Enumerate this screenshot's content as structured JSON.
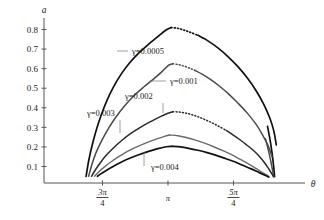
{
  "chart_data": {
    "type": "line",
    "title": "",
    "xlabel": "θ",
    "ylabel": "a",
    "xlim": [
      2.1598,
      4.4506
    ],
    "ylim": [
      0,
      0.87
    ],
    "grid": false,
    "legend_position": "inline-annotations",
    "x_ticks": [
      {
        "value": 2.35619,
        "label": "3π/4",
        "numerator": "3π",
        "denominator": "4"
      },
      {
        "value": 3.14159,
        "label": "π",
        "numerator": "π",
        "denominator": ""
      },
      {
        "value": 3.92699,
        "label": "5π/4",
        "numerator": "5π",
        "denominator": "4"
      }
    ],
    "y_ticks": [
      {
        "value": 0.1,
        "label": "0.1"
      },
      {
        "value": 0.2,
        "label": "0.2"
      },
      {
        "value": 0.3,
        "label": "0.3"
      },
      {
        "value": 0.4,
        "label": "0.4"
      },
      {
        "value": 0.5,
        "label": "0.5"
      },
      {
        "value": 0.6,
        "label": "0.6"
      },
      {
        "value": 0.7,
        "label": "0.7"
      },
      {
        "value": 0.8,
        "label": "0.8"
      }
    ],
    "series": [
      {
        "name": "γ=0.0005",
        "gamma": 0.0005,
        "color": "#111111",
        "stroke_width": 1.7,
        "peak": {
          "x": 3.1416,
          "y": 0.81
        },
        "solid_points": [
          [
            2.1598,
            0.05
          ],
          [
            2.19,
            0.128
          ],
          [
            2.23,
            0.205
          ],
          [
            2.28,
            0.284
          ],
          [
            2.34,
            0.362
          ],
          [
            2.41,
            0.438
          ],
          [
            2.49,
            0.508
          ],
          [
            2.58,
            0.572
          ],
          [
            2.68,
            0.629
          ],
          [
            2.79,
            0.679
          ],
          [
            2.9,
            0.722
          ],
          [
            3.02,
            0.764
          ],
          [
            3.11,
            0.795
          ],
          [
            3.18,
            0.81
          ]
        ],
        "dotted_points": [
          [
            3.18,
            0.81
          ],
          [
            3.26,
            0.806
          ],
          [
            3.34,
            0.796
          ],
          [
            3.42,
            0.784
          ],
          [
            3.5,
            0.77
          ]
        ],
        "tail_points": [
          [
            3.5,
            0.77
          ],
          [
            3.62,
            0.742
          ],
          [
            3.74,
            0.706
          ],
          [
            3.86,
            0.662
          ],
          [
            3.98,
            0.61
          ],
          [
            4.1,
            0.548
          ],
          [
            4.2,
            0.486
          ],
          [
            4.29,
            0.418
          ],
          [
            4.36,
            0.35
          ],
          [
            4.41,
            0.282
          ],
          [
            4.44,
            0.21
          ]
        ],
        "drop_points": [
          [
            4.335,
            0.305
          ],
          [
            4.37,
            0.225
          ],
          [
            4.395,
            0.15
          ],
          [
            4.412,
            0.085
          ],
          [
            4.42,
            0.048
          ]
        ]
      },
      {
        "name": "γ=0.001",
        "gamma": 0.001,
        "color": "#4a4a4a",
        "stroke_width": 1.5,
        "peak": {
          "x": 3.1416,
          "y": 0.625
        },
        "solid_points": [
          [
            2.19,
            0.05
          ],
          [
            2.23,
            0.112
          ],
          [
            2.28,
            0.172
          ],
          [
            2.35,
            0.235
          ],
          [
            2.43,
            0.296
          ],
          [
            2.52,
            0.354
          ],
          [
            2.62,
            0.409
          ],
          [
            2.73,
            0.46
          ],
          [
            2.85,
            0.506
          ],
          [
            2.97,
            0.548
          ],
          [
            3.07,
            0.585
          ],
          [
            3.15,
            0.618
          ],
          [
            3.2,
            0.625
          ]
        ],
        "dotted_points": [
          [
            3.2,
            0.625
          ],
          [
            3.27,
            0.62
          ],
          [
            3.34,
            0.612
          ],
          [
            3.41,
            0.601
          ],
          [
            3.46,
            0.592
          ]
        ],
        "tail_points": [
          [
            3.46,
            0.592
          ],
          [
            3.55,
            0.572
          ],
          [
            3.65,
            0.545
          ],
          [
            3.76,
            0.51
          ],
          [
            3.87,
            0.47
          ],
          [
            3.98,
            0.424
          ],
          [
            4.09,
            0.374
          ],
          [
            4.19,
            0.32
          ],
          [
            4.27,
            0.266
          ],
          [
            4.34,
            0.208
          ],
          [
            4.39,
            0.15
          ]
        ],
        "drop_points": [
          [
            4.31,
            0.242
          ],
          [
            4.35,
            0.175
          ],
          [
            4.38,
            0.115
          ],
          [
            4.4,
            0.07
          ],
          [
            4.41,
            0.048
          ]
        ]
      },
      {
        "name": "γ=0.002",
        "gamma": 0.002,
        "color": "#2a2a2a",
        "stroke_width": 1.5,
        "peak": {
          "x": 3.1416,
          "y": 0.382
        },
        "solid_points": [
          [
            2.225,
            0.05
          ],
          [
            2.27,
            0.082
          ],
          [
            2.33,
            0.119
          ],
          [
            2.4,
            0.157
          ],
          [
            2.49,
            0.196
          ],
          [
            2.59,
            0.234
          ],
          [
            2.7,
            0.27
          ],
          [
            2.82,
            0.303
          ],
          [
            2.94,
            0.331
          ],
          [
            3.05,
            0.355
          ],
          [
            3.14,
            0.372
          ],
          [
            3.2,
            0.38
          ]
        ],
        "dotted_points": [
          [
            3.2,
            0.38
          ],
          [
            3.28,
            0.378
          ],
          [
            3.36,
            0.372
          ],
          [
            3.44,
            0.363
          ],
          [
            3.52,
            0.351
          ],
          [
            3.6,
            0.337
          ],
          [
            3.68,
            0.321
          ],
          [
            3.76,
            0.303
          ],
          [
            3.84,
            0.284
          ]
        ],
        "tail_points": [
          [
            3.84,
            0.284
          ],
          [
            3.92,
            0.262
          ],
          [
            4.0,
            0.238
          ],
          [
            4.08,
            0.212
          ],
          [
            4.16,
            0.184
          ],
          [
            4.23,
            0.155
          ],
          [
            4.29,
            0.124
          ],
          [
            4.34,
            0.094
          ],
          [
            4.38,
            0.067
          ],
          [
            4.406,
            0.048
          ]
        ],
        "drop_points": []
      },
      {
        "name": "γ=0.003",
        "gamma": 0.003,
        "color": "#6a6a6a",
        "stroke_width": 1.4,
        "peak": {
          "x": 3.1416,
          "y": 0.262
        },
        "solid_points": [
          [
            2.26,
            0.05
          ],
          [
            2.31,
            0.072
          ],
          [
            2.38,
            0.098
          ],
          [
            2.46,
            0.124
          ],
          [
            2.55,
            0.15
          ],
          [
            2.65,
            0.176
          ],
          [
            2.76,
            0.199
          ],
          [
            2.88,
            0.221
          ],
          [
            3.0,
            0.24
          ],
          [
            3.1,
            0.254
          ],
          [
            3.16,
            0.261
          ]
        ],
        "dotted_points": [],
        "tail_points": [
          [
            3.16,
            0.261
          ],
          [
            3.26,
            0.257
          ],
          [
            3.36,
            0.248
          ],
          [
            3.47,
            0.235
          ],
          [
            3.58,
            0.219
          ],
          [
            3.69,
            0.201
          ],
          [
            3.8,
            0.181
          ],
          [
            3.91,
            0.159
          ],
          [
            4.01,
            0.136
          ],
          [
            4.11,
            0.112
          ],
          [
            4.2,
            0.089
          ],
          [
            4.28,
            0.068
          ],
          [
            4.35,
            0.05
          ]
        ],
        "drop_points": []
      },
      {
        "name": "γ=0.004",
        "gamma": 0.004,
        "color": "#111111",
        "stroke_width": 1.7,
        "peak": {
          "x": 3.1416,
          "y": 0.203
        },
        "solid_points": [
          [
            2.295,
            0.05
          ],
          [
            2.35,
            0.066
          ],
          [
            2.42,
            0.085
          ],
          [
            2.5,
            0.104
          ],
          [
            2.59,
            0.124
          ],
          [
            2.69,
            0.143
          ],
          [
            2.8,
            0.161
          ],
          [
            2.91,
            0.177
          ],
          [
            3.02,
            0.191
          ],
          [
            3.12,
            0.201
          ],
          [
            3.19,
            0.203
          ]
        ],
        "dotted_points": [],
        "tail_points": [
          [
            3.19,
            0.203
          ],
          [
            3.29,
            0.2
          ],
          [
            3.39,
            0.193
          ],
          [
            3.5,
            0.183
          ],
          [
            3.61,
            0.171
          ],
          [
            3.72,
            0.157
          ],
          [
            3.83,
            0.141
          ],
          [
            3.94,
            0.124
          ],
          [
            4.04,
            0.106
          ],
          [
            4.14,
            0.088
          ],
          [
            4.23,
            0.07
          ],
          [
            4.31,
            0.054
          ],
          [
            4.35,
            0.046
          ]
        ],
        "drop_points": []
      }
    ],
    "annotations": [
      {
        "label": "γ=0.0005",
        "text_x": 132,
        "text_y": 54,
        "leader": [
          [
            117,
            51
          ],
          [
            128,
            51
          ],
          [
            128,
            51
          ]
        ],
        "anchor": [
          117,
          44
        ]
      },
      {
        "label": "γ=0.001",
        "text_x": 170,
        "text_y": 84,
        "leader": [
          [
            150,
            81
          ],
          [
            166,
            81
          ]
        ],
        "anchor": [
          150,
          73
        ]
      },
      {
        "label": "γ=0.002",
        "text_x": 125,
        "text_y": 99,
        "leader": [
          [
            163,
            103
          ],
          [
            163,
            113
          ]
        ],
        "anchor": [
          163,
          113
        ]
      },
      {
        "label": "γ=0.003",
        "text_x": 87,
        "text_y": 116,
        "leader": [
          [
            120,
            120
          ],
          [
            120,
            133
          ]
        ],
        "anchor": [
          120,
          133
        ]
      },
      {
        "label": "γ=0.004",
        "text_x": 151,
        "text_y": 170,
        "leader": [
          [
            144,
            166
          ],
          [
            144,
            152
          ]
        ],
        "anchor": [
          144,
          152
        ]
      }
    ]
  },
  "axes": {
    "y_axis_name": "a",
    "x_axis_name": "θ"
  }
}
